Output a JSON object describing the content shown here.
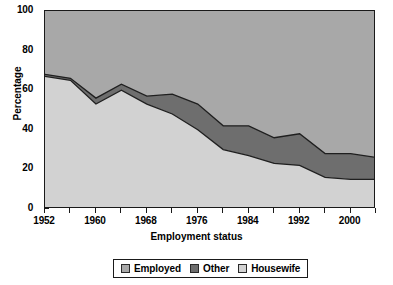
{
  "chart_data": {
    "type": "area",
    "stacked": true,
    "title": "",
    "xlabel": "Employment status",
    "ylabel": "Percentage",
    "xlim": [
      1952,
      2004
    ],
    "ylim": [
      0,
      100
    ],
    "grid": false,
    "legend_position": "bottom",
    "x": [
      1952,
      1956,
      1960,
      1964,
      1968,
      1972,
      1976,
      1980,
      1984,
      1988,
      1992,
      1996,
      2000,
      2004
    ],
    "x_tick_labels": [
      "1952",
      "1960",
      "1968",
      "1976",
      "1984",
      "1992",
      "2000"
    ],
    "x_tick_label_values": [
      1952,
      1960,
      1968,
      1976,
      1984,
      1992,
      2000
    ],
    "x_minor_ticks": [
      1956,
      1964,
      1972,
      1980,
      1988,
      1996,
      2004
    ],
    "y_ticks": [
      0,
      20,
      40,
      60,
      80,
      100
    ],
    "y_tick_labels": [
      "0",
      "20",
      "40",
      "60",
      "80",
      "100"
    ],
    "series": [
      {
        "name": "Housewife",
        "color": "#d2d2d2",
        "values": [
          67,
          65,
          53,
          60,
          53,
          48,
          40,
          30,
          27,
          23,
          22,
          16,
          15,
          15
        ]
      },
      {
        "name": "Other",
        "color": "#6e6e6e",
        "values": [
          1,
          1,
          3,
          3,
          4,
          10,
          13,
          12,
          15,
          13,
          16,
          12,
          13,
          11
        ]
      },
      {
        "name": "Employed",
        "color": "#a8a8a8",
        "values": [
          32,
          34,
          44,
          37,
          43,
          42,
          47,
          58,
          58,
          64,
          62,
          72,
          72,
          74
        ]
      }
    ],
    "cumulative_housewife_top": [
      67,
      65,
      53,
      60,
      53,
      48,
      40,
      30,
      27,
      23,
      22,
      16,
      15,
      15
    ],
    "cumulative_other_top": [
      68,
      66,
      56,
      63,
      57,
      58,
      53,
      42,
      42,
      36,
      38,
      28,
      28,
      26
    ]
  },
  "legend": {
    "items": [
      {
        "label": "Employed",
        "color": "#a8a8a8"
      },
      {
        "label": "Other",
        "color": "#6e6e6e"
      },
      {
        "label": "Housewife",
        "color": "#d2d2d2"
      }
    ]
  },
  "axis": {
    "y_title": "Percentage",
    "x_title": "Employment status"
  },
  "colors": {
    "employed": "#a8a8a8",
    "other": "#6e6e6e",
    "housewife": "#d2d2d2",
    "axis": "#1a1a1a",
    "background": "#ffffff"
  }
}
